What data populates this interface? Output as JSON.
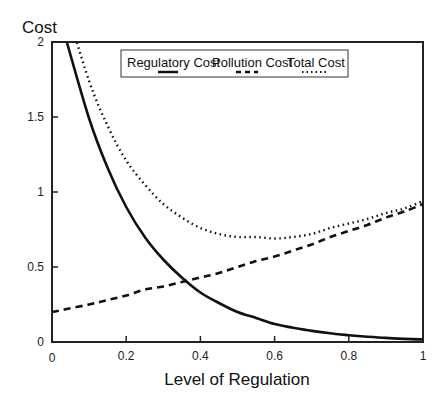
{
  "chart_data": {
    "type": "line",
    "title": "",
    "xlabel": "Level of Regulation",
    "ylabel": "Cost",
    "xlim": [
      0,
      1
    ],
    "ylim": [
      0,
      2
    ],
    "grid": false,
    "legend_position": "top-center (boxed, inside plot)",
    "x_ticks": [
      "0",
      "0.2",
      "0.4",
      "0.6",
      "0.8",
      "1"
    ],
    "y_ticks": [
      "0",
      "0.5",
      "1",
      "1.5",
      "2"
    ],
    "x": [
      0.04,
      0.1,
      0.15,
      0.2,
      0.25,
      0.3,
      0.35,
      0.4,
      0.45,
      0.5,
      0.55,
      0.6,
      0.65,
      0.7,
      0.75,
      0.8,
      0.85,
      0.9,
      0.95,
      1.0
    ],
    "series": [
      {
        "name": "Regulatory Cost",
        "style": "solid",
        "values": [
          2.0,
          1.49,
          1.16,
          0.9,
          0.7,
          0.55,
          0.43,
          0.33,
          0.26,
          0.2,
          0.16,
          0.12,
          0.095,
          0.074,
          0.058,
          0.045,
          0.035,
          0.027,
          0.021,
          0.017
        ]
      },
      {
        "name": "Pollution Cost",
        "style": "dashed",
        "values": [
          0.22,
          0.25,
          0.28,
          0.31,
          0.35,
          0.37,
          0.4,
          0.43,
          0.46,
          0.5,
          0.54,
          0.57,
          0.61,
          0.65,
          0.7,
          0.74,
          0.78,
          0.83,
          0.87,
          0.92
        ]
      },
      {
        "name": "Total Cost",
        "style": "dotted",
        "values": [
          2.22,
          1.74,
          1.44,
          1.21,
          1.05,
          0.92,
          0.83,
          0.76,
          0.72,
          0.7,
          0.7,
          0.69,
          0.7,
          0.72,
          0.76,
          0.79,
          0.82,
          0.86,
          0.89,
          0.94
        ]
      }
    ]
  },
  "axes": {
    "ylabel": "Cost",
    "xlabel": "Level of Regulation"
  },
  "legend": {
    "items": [
      {
        "label": "Regulatory Cost",
        "style": "solid"
      },
      {
        "label": "Pollution Cost",
        "style": "dashed"
      },
      {
        "label": "Total Cost",
        "style": "dotted"
      }
    ]
  },
  "colors": {
    "line": "#111111",
    "axis": "#222222",
    "background": "#ffffff"
  }
}
